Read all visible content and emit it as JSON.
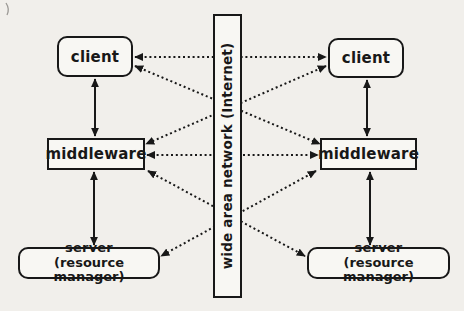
{
  "diagram": {
    "colors": {
      "background": "#f1efeb",
      "box_fill": "#f8f7f3",
      "line": "#181818"
    },
    "nodes": {
      "client_left": {
        "label": "client",
        "shape": "rounded-rect"
      },
      "client_right": {
        "label": "client",
        "shape": "rounded-rect"
      },
      "middleware_left": {
        "label": "middleware",
        "shape": "rect"
      },
      "middleware_right": {
        "label": "middleware",
        "shape": "rect"
      },
      "server_left": {
        "line1": "server",
        "line2": "(resource manager)",
        "shape": "rounded-rect"
      },
      "server_right": {
        "line1": "server",
        "line2": "(resource manager)",
        "shape": "rounded-rect"
      },
      "wan": {
        "label": "wide area network (Internet)",
        "shape": "rect",
        "text_orientation": "vertical-bottom-to-top"
      }
    },
    "edges": [
      {
        "from": "client_left",
        "to": "middleware_left",
        "style": "solid",
        "arrows": "both"
      },
      {
        "from": "middleware_left",
        "to": "server_left",
        "style": "solid",
        "arrows": "both"
      },
      {
        "from": "client_right",
        "to": "middleware_right",
        "style": "solid",
        "arrows": "both"
      },
      {
        "from": "middleware_right",
        "to": "server_right",
        "style": "solid",
        "arrows": "both"
      },
      {
        "from": "client_left",
        "to": "client_right",
        "style": "dotted",
        "arrows": "both",
        "via": "wan"
      },
      {
        "from": "middleware_left",
        "to": "middleware_right",
        "style": "dotted",
        "arrows": "both",
        "via": "wan"
      },
      {
        "from": "client_left",
        "to": "middleware_right",
        "style": "dotted",
        "arrows": "both",
        "via": "wan"
      },
      {
        "from": "client_right",
        "to": "middleware_left",
        "style": "dotted",
        "arrows": "both",
        "via": "wan"
      },
      {
        "from": "middleware_left",
        "to": "server_right",
        "style": "dotted",
        "arrows": "both",
        "via": "wan"
      },
      {
        "from": "middleware_right",
        "to": "server_left",
        "style": "dotted",
        "arrows": "both",
        "via": "wan"
      }
    ]
  }
}
